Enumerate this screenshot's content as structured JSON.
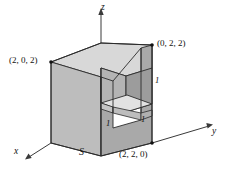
{
  "figure": {
    "kind": "3d-solid-diagram",
    "surface_label": "S",
    "axes": [
      {
        "name": "z-axis",
        "label": "z",
        "direction": "up"
      },
      {
        "name": "y-axis",
        "label": "y",
        "direction": "right"
      },
      {
        "name": "x-axis",
        "label": "x",
        "direction": "lower-left"
      }
    ],
    "vertex_labels": [
      {
        "name": "vertex-2-0-2",
        "text": "(2, 0, 2)"
      },
      {
        "name": "vertex-0-2-2",
        "text": "(0, 2, 2)"
      },
      {
        "name": "vertex-2-2-0",
        "text": "(2, 2, 0)"
      }
    ],
    "dimension_labels": [
      {
        "name": "notch-depth",
        "text": "1"
      },
      {
        "name": "notch-width",
        "text": "1"
      },
      {
        "name": "notch-height",
        "text": "1"
      }
    ],
    "colors": {
      "outline": "#2b2b2b",
      "top_face": "#d6d6d6",
      "front_face": "#bdbdbd",
      "right_face": "#a8a8a8",
      "notch_back": "#b2b2b2",
      "notch_side": "#9a9a9a",
      "notch_floor": "#dedede",
      "axis": "#3a3a3a",
      "background": "#ffffff"
    }
  }
}
